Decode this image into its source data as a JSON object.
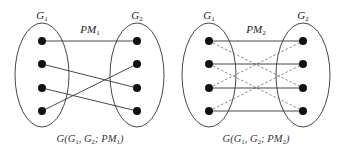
{
  "diagrams": [
    {
      "set_left": "G1",
      "set_right": "G2",
      "matching_label": "PM",
      "matching_index": "1",
      "caption": "G(G1, G2; PM1)",
      "nodes_per_side": 4,
      "solid_edges": [
        [
          1,
          1
        ],
        [
          2,
          3
        ],
        [
          3,
          4
        ],
        [
          4,
          2
        ]
      ],
      "dashed_edges": []
    },
    {
      "set_left": "G1",
      "set_right": "G2",
      "matching_label": "PM",
      "matching_index": "2",
      "caption": "G(G1, G2; PM2)",
      "nodes_per_side": 4,
      "solid_edges": [
        [
          1,
          1
        ],
        [
          2,
          2
        ],
        [
          3,
          3
        ],
        [
          4,
          4
        ]
      ],
      "dashed_edges": [
        [
          1,
          3
        ],
        [
          2,
          4
        ],
        [
          3,
          1
        ],
        [
          4,
          2
        ]
      ]
    }
  ],
  "colors": {
    "line": "#333333",
    "node": "#111111"
  }
}
